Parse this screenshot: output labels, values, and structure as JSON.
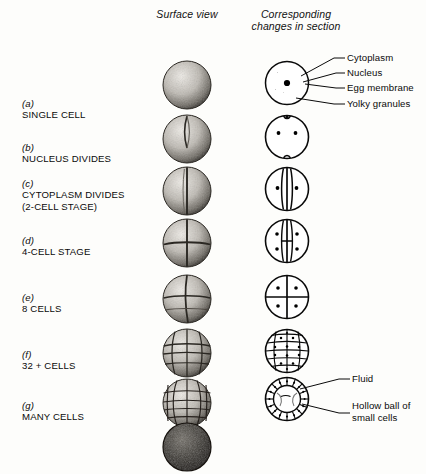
{
  "figure": {
    "headers": {
      "surface_view": "Surface\nview",
      "section_view": "Corresponding\nchanges in\nsection"
    },
    "stages": [
      {
        "index": "(a)",
        "label": "SINGLE CELL",
        "surface": "single-sphere-stippled",
        "section": "single-cell-section"
      },
      {
        "index": "(b)",
        "label": "NUCLEUS DIVIDES",
        "surface": "two-lobe-sphere",
        "section": "two-nuclei-section"
      },
      {
        "index": "(c)",
        "label": "CYTOPLASM DIVIDES\n    (2-CELL STAGE)",
        "surface": "two-cell-sphere",
        "section": "two-cell-section"
      },
      {
        "index": "(d)",
        "label": "4-CELL STAGE",
        "surface": "four-cell-sphere",
        "section": "four-cell-section"
      },
      {
        "index": "(e)",
        "label": "8 CELLS",
        "surface": "eight-cell-sphere",
        "section": "eight-cell-section"
      },
      {
        "index": "(f)",
        "label": "32 + CELLS",
        "surface": "thirty-two-cell-sphere",
        "section": "morula-section"
      },
      {
        "index": "(g)",
        "label": "MANY CELLS",
        "surface": "many-cell-sphere",
        "section": "blastula-section"
      }
    ],
    "extra_surface": {
      "name": "dense-many-cell-sphere",
      "label": ""
    },
    "annotations_top": [
      {
        "name": "cytoplasm",
        "text": "Cytoplasm"
      },
      {
        "name": "nucleus",
        "text": "Nucleus"
      },
      {
        "name": "egg-membrane",
        "text": "Egg membrane"
      },
      {
        "name": "yolky-granules",
        "text": "Yolky granules"
      }
    ],
    "annotations_bottom": [
      {
        "name": "fluid",
        "text": "Fluid"
      },
      {
        "name": "hollow-ball-of-cells",
        "text": "Hollow ball of\nsmall cells"
      }
    ],
    "colors": {
      "ink": "#0a0a0a",
      "paper": "#fdfdfb",
      "shade_light": "#d9d6d0",
      "shade_mid": "#8f8b85",
      "shade_dark": "#3a3732"
    }
  }
}
